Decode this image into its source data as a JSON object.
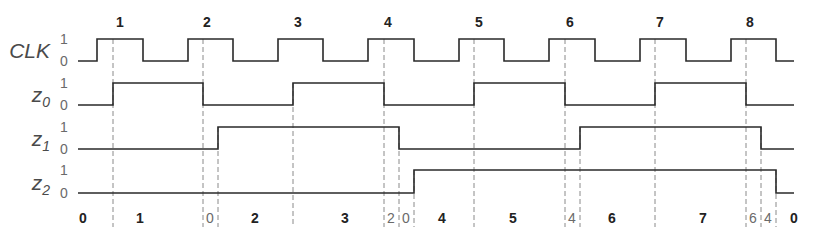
{
  "colors": {
    "wave": "#2a2a2a",
    "dashed": "#8a8a8a",
    "label": "#4a4a4a"
  },
  "clock_edge_numbers": [
    {
      "label": "1",
      "x": 120
    },
    {
      "label": "2",
      "x": 207
    },
    {
      "label": "3",
      "x": 298
    },
    {
      "label": "4",
      "x": 388
    },
    {
      "label": "5",
      "x": 479
    },
    {
      "label": "6",
      "x": 570
    },
    {
      "label": "7",
      "x": 660
    },
    {
      "label": "8",
      "x": 750
    }
  ],
  "signals": [
    {
      "name": "CLK",
      "sub": "",
      "high_y": 39,
      "low_y": 61,
      "start_x": 78,
      "end_x": 794,
      "initial": 0,
      "transitions": [
        97,
        143,
        188,
        233,
        278,
        323,
        368,
        414,
        459,
        504,
        549,
        595,
        640,
        686,
        731,
        776
      ]
    },
    {
      "name": "z",
      "sub": "0",
      "high_y": 83,
      "low_y": 105,
      "start_x": 78,
      "end_x": 794,
      "initial": 0,
      "transitions": [
        113,
        203,
        293,
        384,
        474,
        565,
        655,
        746
      ]
    },
    {
      "name": "z",
      "sub": "1",
      "high_y": 127,
      "low_y": 149,
      "start_x": 78,
      "end_x": 794,
      "initial": 0,
      "transitions": [
        218,
        399,
        580,
        761
      ]
    },
    {
      "name": "z",
      "sub": "2",
      "high_y": 170,
      "low_y": 193,
      "start_x": 78,
      "end_x": 794,
      "initial": 0,
      "transitions": [
        414,
        776
      ]
    }
  ],
  "level_labels": {
    "high": "1",
    "low": "0"
  },
  "dashed_lines": [
    {
      "x": 113,
      "y1": 39,
      "y2": 227
    },
    {
      "x": 203,
      "y1": 39,
      "y2": 227
    },
    {
      "x": 218,
      "y1": 127,
      "y2": 227
    },
    {
      "x": 293,
      "y1": 83,
      "y2": 227
    },
    {
      "x": 384,
      "y1": 39,
      "y2": 227
    },
    {
      "x": 399,
      "y1": 127,
      "y2": 227
    },
    {
      "x": 414,
      "y1": 170,
      "y2": 227
    },
    {
      "x": 474,
      "y1": 39,
      "y2": 227
    },
    {
      "x": 565,
      "y1": 39,
      "y2": 227
    },
    {
      "x": 580,
      "y1": 127,
      "y2": 227
    },
    {
      "x": 655,
      "y1": 39,
      "y2": 227
    },
    {
      "x": 746,
      "y1": 39,
      "y2": 227
    },
    {
      "x": 761,
      "y1": 127,
      "y2": 227
    },
    {
      "x": 776,
      "y1": 170,
      "y2": 227
    }
  ],
  "states": [
    {
      "label": "0",
      "x": 83,
      "bold": true
    },
    {
      "label": "1",
      "x": 140,
      "bold": true
    },
    {
      "label": "0",
      "x": 210,
      "bold": false
    },
    {
      "label": "2",
      "x": 255,
      "bold": true
    },
    {
      "label": "3",
      "x": 345,
      "bold": true
    },
    {
      "label": "2",
      "x": 391,
      "bold": false
    },
    {
      "label": "0",
      "x": 406,
      "bold": false
    },
    {
      "label": "4",
      "x": 442,
      "bold": true
    },
    {
      "label": "5",
      "x": 513,
      "bold": true
    },
    {
      "label": "4",
      "x": 572,
      "bold": false
    },
    {
      "label": "6",
      "x": 612,
      "bold": true
    },
    {
      "label": "7",
      "x": 703,
      "bold": true
    },
    {
      "label": "6",
      "x": 753,
      "bold": false
    },
    {
      "label": "4",
      "x": 768,
      "bold": false
    },
    {
      "label": "0",
      "x": 794,
      "bold": true
    }
  ]
}
